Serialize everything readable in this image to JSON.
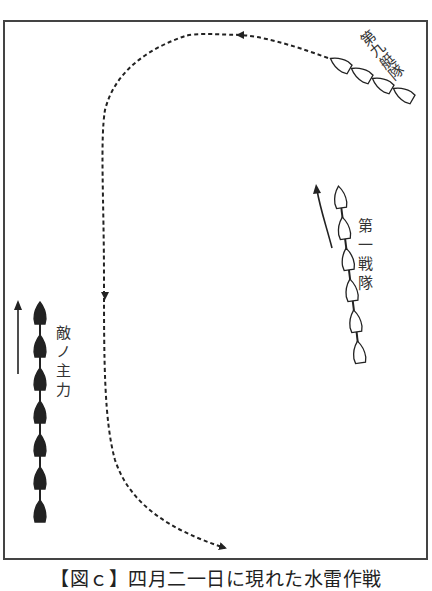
{
  "caption": "【図ｃ】四月二一日に現れた水雷作戦",
  "labels": {
    "ninth_squadron": "第九艇隊",
    "first_fleet": "第一戦隊",
    "enemy_main": "敵ノ主力"
  },
  "units": [
    {
      "id": "ninth-squadron",
      "label_key": "ninth_squadron",
      "ships": 4,
      "ship_style": "hollow"
    },
    {
      "id": "first-fleet",
      "label_key": "first_fleet",
      "ships": 6,
      "ship_style": "hollow"
    },
    {
      "id": "enemy-main",
      "label_key": "enemy_main",
      "ships": 7,
      "ship_style": "filled"
    }
  ],
  "colors": {
    "ink": "#222222",
    "frame": "#444444",
    "background": "#ffffff"
  }
}
